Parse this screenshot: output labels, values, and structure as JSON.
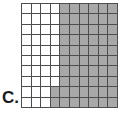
{
  "figure": {
    "label": "C.",
    "label_name": "figure-letter-label"
  },
  "chart_data": {
    "type": "heatmap",
    "title": "",
    "subtitle": "",
    "xlabel": "",
    "ylabel": "",
    "rows": 10,
    "columns": 10,
    "total_cells": 100,
    "shaded_cells": 62,
    "unshaded_cells": 38,
    "shaded_fraction": "62/100",
    "shaded_decimal": 0.62,
    "shaded_percent": 62,
    "legend": [
      {
        "key": "shaded",
        "label": "Shaded",
        "color": "#a8a8a8"
      },
      {
        "key": "unshaded",
        "label": "Unshaded",
        "color": "#ffffff"
      }
    ],
    "grid_line_color": "#4d4d4d",
    "grid": [
      [
        0,
        0,
        0,
        0,
        1,
        1,
        1,
        1,
        1,
        1
      ],
      [
        0,
        0,
        0,
        0,
        1,
        1,
        1,
        1,
        1,
        1
      ],
      [
        0,
        0,
        0,
        0,
        1,
        1,
        1,
        1,
        1,
        1
      ],
      [
        0,
        0,
        0,
        0,
        1,
        1,
        1,
        1,
        1,
        1
      ],
      [
        0,
        0,
        0,
        0,
        1,
        1,
        1,
        1,
        1,
        1
      ],
      [
        0,
        0,
        0,
        0,
        1,
        1,
        1,
        1,
        1,
        1
      ],
      [
        0,
        0,
        0,
        0,
        1,
        1,
        1,
        1,
        1,
        1
      ],
      [
        0,
        0,
        0,
        0,
        1,
        1,
        1,
        1,
        1,
        1
      ],
      [
        0,
        0,
        0,
        1,
        1,
        1,
        1,
        1,
        1,
        1
      ],
      [
        0,
        0,
        0,
        1,
        1,
        1,
        1,
        1,
        1,
        1
      ]
    ],
    "row_shaded_counts": [
      6,
      6,
      6,
      6,
      6,
      6,
      6,
      6,
      7,
      7
    ],
    "column_shaded_counts": [
      0,
      0,
      0,
      2,
      10,
      10,
      10,
      10,
      10,
      10
    ]
  }
}
